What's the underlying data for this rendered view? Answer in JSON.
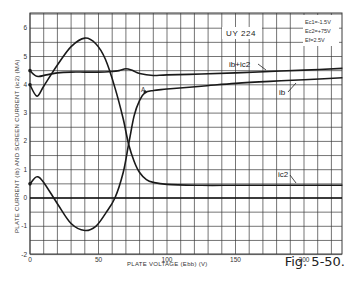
{
  "chart_data": {
    "type": "line",
    "title": "UY 224",
    "xlabel": "PLATE VOLTAGE (Ebb) (V)",
    "ylabel": "PLATE CURRENT (ib) AND SCREEN CURRENT (ic2) (MA)",
    "xlim": [
      0,
      228
    ],
    "ylim": [
      -2,
      6.5
    ],
    "x_ticks": [
      0,
      50,
      100,
      150,
      200
    ],
    "y_ticks": [
      -2,
      -1,
      0,
      1,
      2,
      3,
      4,
      5,
      6
    ],
    "grid": true,
    "grid_step_x": 10,
    "grid_step_y": 0.5,
    "conditions": [
      "Ec1 = -1.5V",
      "Ec2 = +75V",
      "Ef = 2.5V"
    ],
    "annotations": [
      {
        "text": "A",
        "x": 84,
        "y": 3.75
      },
      {
        "text": "Fig. 5-50.",
        "position": "bottom-right"
      }
    ],
    "series": [
      {
        "name": "ib + ic2",
        "x": [
          0,
          5,
          12,
          20,
          30,
          40,
          50,
          60,
          65,
          70,
          75,
          80,
          90,
          100,
          125,
          150,
          175,
          200,
          228
        ],
        "values": [
          4.5,
          4.3,
          4.35,
          4.42,
          4.45,
          4.45,
          4.45,
          4.47,
          4.5,
          4.57,
          4.5,
          4.4,
          4.33,
          4.35,
          4.38,
          4.42,
          4.47,
          4.52,
          4.58
        ]
      },
      {
        "name": "ib",
        "x": [
          0,
          5,
          10,
          20,
          30,
          40,
          48,
          55,
          62,
          68,
          72,
          76,
          80,
          84,
          90,
          100,
          125,
          150,
          175,
          200,
          228
        ],
        "values": [
          0.5,
          0.75,
          0.55,
          -0.2,
          -0.9,
          -1.15,
          -1.0,
          -0.55,
          0.0,
          0.9,
          1.9,
          2.9,
          3.45,
          3.72,
          3.8,
          3.85,
          3.95,
          4.05,
          4.12,
          4.18,
          4.25
        ]
      },
      {
        "name": "ic2",
        "x": [
          0,
          5,
          10,
          20,
          30,
          40,
          48,
          55,
          62,
          68,
          72,
          76,
          80,
          85,
          90,
          100,
          125,
          150,
          175,
          200,
          228
        ],
        "values": [
          4.0,
          3.6,
          3.95,
          4.7,
          5.35,
          5.65,
          5.45,
          4.9,
          3.9,
          2.8,
          1.9,
          1.3,
          0.9,
          0.65,
          0.55,
          0.48,
          0.45,
          0.45,
          0.45,
          0.45,
          0.45
        ]
      }
    ]
  },
  "labels": {
    "title": "UY 224",
    "cond1": "Ec1=-1.5V",
    "cond2": "Ec2=+75V",
    "cond3": "Ef=2.5V",
    "ylabel": "PLATE CURRENT (ib) AND SCREEN CURRENT (ic2) (MA)",
    "xlabel": "PLATE VOLTAGE (Ebb) (V)",
    "sum_label": "ib+ic2",
    "ib_label": "ib",
    "ic2_label": "ic2",
    "point_a": "A",
    "figure": "Fig. 5-50."
  },
  "colors": {
    "grid": "#3a3a3a",
    "curve": "#1a1a1a",
    "background": "#ffffff"
  }
}
